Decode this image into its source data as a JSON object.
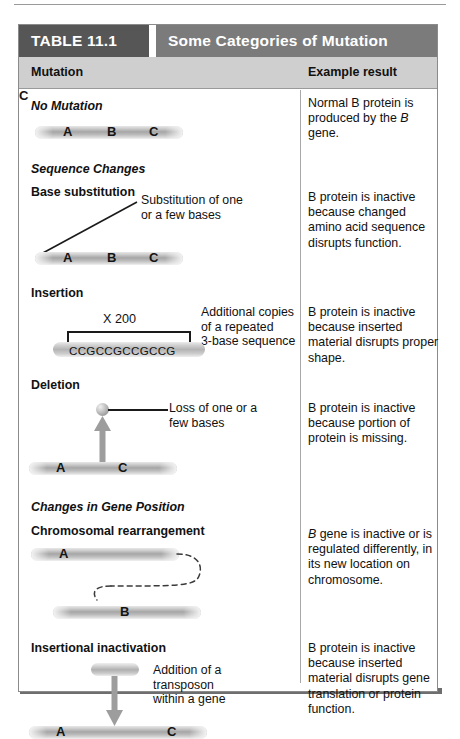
{
  "table": {
    "number_label": "TABLE 11.1",
    "title": "Some Categories of Mutation",
    "columns": {
      "left": "Mutation",
      "right": "Example result"
    },
    "colors": {
      "number_bg": "#565656",
      "title_bg": "#7b7b7b",
      "column_header_bg": "#cfcfcf",
      "border": "#8b8b8b",
      "shadow": "#6e6e6e",
      "text": "#111111"
    }
  },
  "rows": [
    {
      "section": "No Mutation",
      "subheading": "",
      "diagram": {
        "type": "gene-bar",
        "genes": [
          "A",
          "B",
          "C"
        ]
      },
      "annotation": "",
      "result": "Normal B protein is produced by the <i>B</i> gene."
    },
    {
      "section": "Sequence Changes",
      "subheading": "Base substitution",
      "diagram": {
        "type": "gene-bar-with-leader",
        "genes": [
          "A",
          "B",
          "C"
        ]
      },
      "annotation": "Substitution of one or a few bases",
      "result": "B protein is inactive because changed amino acid sequence disrupts function."
    },
    {
      "section": "",
      "subheading": "Insertion",
      "diagram": {
        "type": "repeat-sequence",
        "sequence": "CCGCCGCCGCCG",
        "repeat_label": "X 200"
      },
      "annotation": "Additional copies of a repeated 3-base sequence",
      "result": "B protein is inactive because inserted material disrupts proper shape."
    },
    {
      "section": "",
      "subheading": "Deletion",
      "diagram": {
        "type": "deletion",
        "genes": [
          "A",
          "C"
        ]
      },
      "annotation": "Loss of one or a few bases",
      "result": "B protein is inactive because portion of protein is missing."
    },
    {
      "section": "Changes in Gene Position",
      "subheading": "Chromosomal rearrangement",
      "diagram": {
        "type": "rearrangement",
        "top_genes": [
          "A",
          "C"
        ],
        "bottom_genes": [
          "B"
        ]
      },
      "annotation": "",
      "result": "<i>B</i> gene is inactive or is regulated differently, in its new location on chromosome."
    },
    {
      "section": "",
      "subheading": "Insertional inactivation",
      "diagram": {
        "type": "transposon",
        "genes": [
          "A",
          "C"
        ]
      },
      "annotation": "Addition of a transposon within a gene",
      "result": "B protein is inactive because inserted material disrupts gene translation or protein function."
    }
  ],
  "labels": {
    "no_mutation": "No Mutation",
    "sequence_changes": "Sequence Changes",
    "base_substitution": "Base substitution",
    "insertion": "Insertion",
    "deletion": "Deletion",
    "changes_in_gene_position": "Changes in Gene Position",
    "chromosomal_rearrangement": "Chromosomal rearrangement",
    "insertional_inactivation": "Insertional inactivation",
    "gene_a": "A",
    "gene_b": "B",
    "gene_c": "C",
    "repeat_multiplier": "X 200",
    "repeat_sequence": "CCGCCGCCGCCG",
    "ann_substitution_1": "Substitution of one",
    "ann_substitution_2": "or a few bases",
    "ann_insertion_1": "Additional copies",
    "ann_insertion_2": "of a repeated",
    "ann_insertion_3": "3-base sequence",
    "ann_deletion_1": "Loss of one or a",
    "ann_deletion_2": "few bases",
    "ann_transposon_1": "Addition of a",
    "ann_transposon_2": "transposon",
    "ann_transposon_3": "within a gene"
  },
  "results_plain": {
    "r1_a": "Normal B protein is",
    "r1_b": "produced by the ",
    "r1_b_italic": "B",
    "r1_c": "gene.",
    "r2": "B protein is inactive because changed amino acid sequence disrupts function.",
    "r3": "B protein is inactive because inserted material disrupts proper shape.",
    "r4": "B protein is inactive because portion of protein is missing.",
    "r5_italic": "B",
    "r5": " gene is inactive or is regulated differently, in its new location on chromosome.",
    "r6": "B protein is inactive because inserted material disrupts gene translation or protein function."
  }
}
